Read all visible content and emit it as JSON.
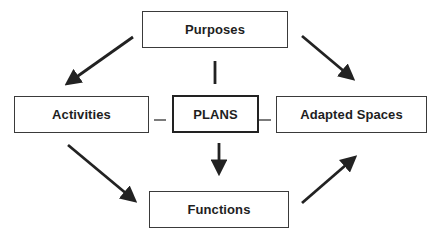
{
  "diagram": {
    "nodes": {
      "purposes": "Purposes",
      "activities": "Activities",
      "plans": "PLANS",
      "adapted_spaces": "Adapted Spaces",
      "functions": "Functions"
    },
    "edges": [
      {
        "from": "Purposes",
        "to": "Activities",
        "type": "arrow"
      },
      {
        "from": "Purposes",
        "to": "Adapted Spaces",
        "type": "arrow"
      },
      {
        "from": "Activities",
        "to": "Functions",
        "type": "arrow"
      },
      {
        "from": "Functions",
        "to": "Adapted Spaces",
        "type": "arrow"
      },
      {
        "from": "Purposes",
        "to": "PLANS",
        "type": "line"
      },
      {
        "from": "PLANS",
        "to": "Functions",
        "type": "arrow"
      },
      {
        "from": "Activities",
        "to": "PLANS",
        "type": "line"
      },
      {
        "from": "PLANS",
        "to": "Adapted Spaces",
        "type": "line"
      }
    ],
    "colors": {
      "stroke": "#222222",
      "background": "#ffffff"
    }
  }
}
